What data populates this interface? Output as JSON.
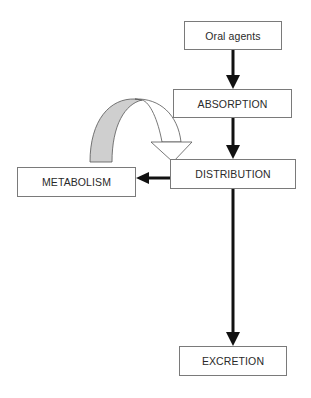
{
  "diagram": {
    "type": "flowchart",
    "background_ghost_text": "...ies in the disposition...",
    "nodes": {
      "oral_agents": "Oral agents",
      "absorption": "ABSORPTION",
      "distribution": "DISTRIBUTION",
      "metabolism": "METABOLISM",
      "excretion": "EXCRETION"
    },
    "edges": [
      {
        "from": "Oral agents",
        "to": "ABSORPTION",
        "style": "solid-arrow"
      },
      {
        "from": "ABSORPTION",
        "to": "DISTRIBUTION",
        "style": "solid-arrow"
      },
      {
        "from": "DISTRIBUTION",
        "to": "METABOLISM",
        "style": "solid-arrow"
      },
      {
        "from": "METABOLISM",
        "to": "DISTRIBUTION",
        "style": "curved-hollow-arrow"
      },
      {
        "from": "DISTRIBUTION",
        "to": "EXCRETION",
        "style": "solid-arrow"
      }
    ],
    "colors": {
      "line": "#111111",
      "box_border": "#7a7a7a",
      "curved_arrow_shade": "#cfcfcf"
    }
  }
}
